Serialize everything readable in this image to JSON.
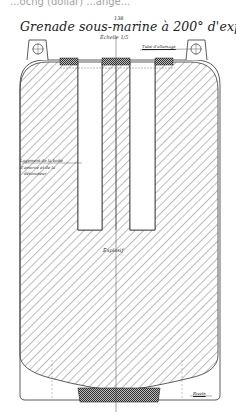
{
  "page": {
    "cut_caption": "...ocng (dollar) ...ange...",
    "plate_number": "138",
    "title": "Grenade sous-marine à 200° d'explosif",
    "scale": "Échelle 1/5"
  },
  "labels": {
    "top_right": "Tube d'allumage",
    "left_1": "Logement de la boîte",
    "left_2": "d'amorce et de la",
    "left_3": "détonateur",
    "center": "Explosif",
    "bottom_right": "Rivets"
  },
  "colors": {
    "ink": "#2a2a2a",
    "hatch": "#7a7a7a",
    "paper": "#ffffff"
  }
}
